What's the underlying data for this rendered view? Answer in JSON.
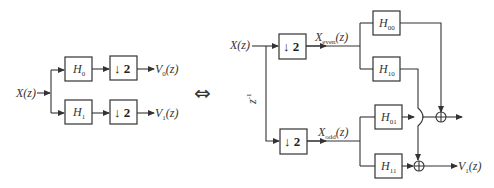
{
  "left_diagram": {
    "input": {
      "label": "X(z)"
    },
    "branches": [
      {
        "filter": {
          "name": "H",
          "sub": "0"
        },
        "decimator": {
          "arrow": "↓",
          "factor": "2"
        },
        "output": {
          "name": "V",
          "sub": "0",
          "arg": "(z)"
        }
      },
      {
        "filter": {
          "name": "H",
          "sub": "1"
        },
        "decimator": {
          "arrow": "↓",
          "factor": "2"
        },
        "output": {
          "name": "V",
          "sub": "1",
          "arg": "(z)"
        }
      }
    ]
  },
  "equivalence_symbol": "⇔",
  "right_diagram": {
    "input": {
      "label": "X(z)"
    },
    "delay": {
      "name": "z",
      "sup": "-1"
    },
    "decimators": [
      {
        "arrow": "↓",
        "factor": "2",
        "output": {
          "name": "X",
          "sub": "even",
          "arg": "(z)"
        }
      },
      {
        "arrow": "↓",
        "factor": "2",
        "output": {
          "name": "X",
          "sub": "odd",
          "arg": "(z)"
        }
      }
    ],
    "filters": [
      {
        "name": "H",
        "sub": "00"
      },
      {
        "name": "H",
        "sub": "10"
      },
      {
        "name": "H",
        "sub": "01"
      },
      {
        "name": "H",
        "sub": "11"
      }
    ],
    "adders": [
      {
        "symbol": "⊕",
        "position": "top"
      },
      {
        "symbol": "⊕",
        "position": "bottom"
      }
    ],
    "output": {
      "name": "V",
      "sub": "1",
      "arg": "(z)"
    }
  },
  "colors": {
    "line": "#333333",
    "background": "#ffffff"
  }
}
